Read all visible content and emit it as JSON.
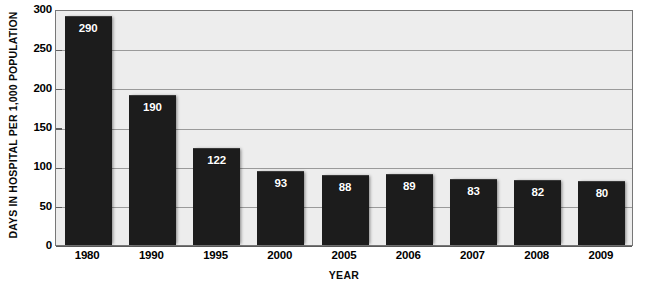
{
  "chart_data": {
    "type": "bar",
    "title": "",
    "xlabel": "YEAR",
    "ylabel": "DAYS IN HOSPITAL PER 1,000 POPULATION",
    "categories": [
      "1980",
      "1990",
      "1995",
      "2000",
      "2005",
      "2006",
      "2007",
      "2008",
      "2009"
    ],
    "values": [
      290,
      190,
      122,
      93,
      88,
      89,
      83,
      82,
      80
    ],
    "value_labels": [
      "290",
      "190",
      "122",
      "93",
      "88",
      "89",
      "83",
      "82",
      "80"
    ],
    "ylim": [
      0,
      300
    ],
    "ytick_values": [
      0,
      50,
      100,
      150,
      200,
      250,
      300
    ],
    "ytick_labels": [
      "0",
      "50",
      "100",
      "150",
      "200",
      "250",
      "300"
    ],
    "grid": true,
    "grid_axis": "y",
    "legend": false,
    "legend_position": "none",
    "bar_color": "#1c1c1c",
    "plot_background": "#ededed",
    "gridline_color": "#9a9a9a",
    "axis_color": "#777777",
    "value_label_color": "#ffffff",
    "text_color": "#000000"
  }
}
